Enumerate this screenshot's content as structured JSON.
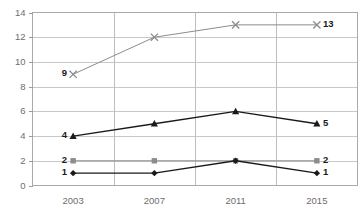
{
  "chart_data": {
    "type": "line",
    "title": "",
    "subtitle": "",
    "xlabel": "",
    "ylabel": "",
    "categories": [
      "2003",
      "2007",
      "2011",
      "2015"
    ],
    "ylim": [
      0,
      14
    ],
    "yticks": [
      0,
      2,
      4,
      6,
      8,
      10,
      12,
      14
    ],
    "ytick_labels": [
      "0",
      "2",
      "4",
      "6",
      "8",
      "10",
      "12",
      "14"
    ],
    "grid": true,
    "legend": "none",
    "series": [
      {
        "name": "series-x",
        "marker": "x-cross",
        "color": "#8c8c8c",
        "values": [
          9,
          12,
          13,
          13
        ],
        "start_label": "9",
        "end_label": "13"
      },
      {
        "name": "series-triangle",
        "marker": "triangle",
        "color": "#1a1a1a",
        "values": [
          4,
          5,
          6,
          5
        ],
        "start_label": "4",
        "end_label": "5"
      },
      {
        "name": "series-square",
        "marker": "square",
        "color": "#8c8c8c",
        "values": [
          2,
          2,
          2,
          2
        ],
        "start_label": "2",
        "end_label": "2"
      },
      {
        "name": "series-diamond",
        "marker": "diamond",
        "color": "#1a1a1a",
        "values": [
          1,
          1,
          2,
          1
        ],
        "start_label": "1",
        "end_label": "1"
      }
    ]
  },
  "axes": {
    "y_tick_color": "#6d6d6d",
    "x_tick_color": "#6d6d6d",
    "grid_color": "#c8c8c8",
    "border_color": "#aaaaaa"
  }
}
